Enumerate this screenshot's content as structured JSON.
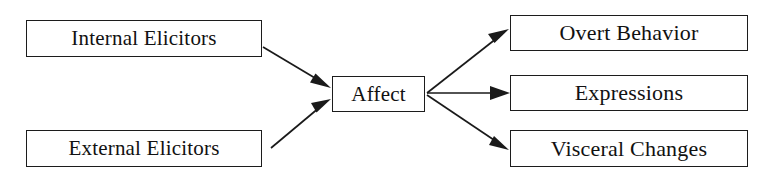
{
  "diagram": {
    "background_color": "#ffffff",
    "line_color": "#1a1a1a",
    "text_color": "#111111",
    "nodes": [
      {
        "id": "internal-elicitors",
        "label": "Internal Elicitors",
        "column": "left",
        "row": 1
      },
      {
        "id": "external-elicitors",
        "label": "External Elicitors",
        "column": "left",
        "row": 2
      },
      {
        "id": "affect",
        "label": "Affect",
        "column": "center",
        "row": 1
      },
      {
        "id": "overt-behavior",
        "label": "Overt Behavior",
        "column": "right",
        "row": 1
      },
      {
        "id": "expressions",
        "label": "Expressions",
        "column": "right",
        "row": 2
      },
      {
        "id": "visceral-changes",
        "label": "Visceral Changes",
        "column": "right",
        "row": 3
      }
    ],
    "edges": [
      {
        "id": "internal-to-affect",
        "from": "internal-elicitors",
        "to": "affect",
        "style": "solid-arrow"
      },
      {
        "id": "external-to-affect",
        "from": "external-elicitors",
        "to": "affect",
        "style": "solid-arrow"
      },
      {
        "id": "affect-to-overt",
        "from": "affect",
        "to": "overt-behavior",
        "style": "solid-arrow"
      },
      {
        "id": "affect-to-expr",
        "from": "affect",
        "to": "expressions",
        "style": "solid-arrow"
      },
      {
        "id": "affect-to-visceral",
        "from": "affect",
        "to": "visceral-changes",
        "style": "solid-arrow"
      }
    ]
  }
}
